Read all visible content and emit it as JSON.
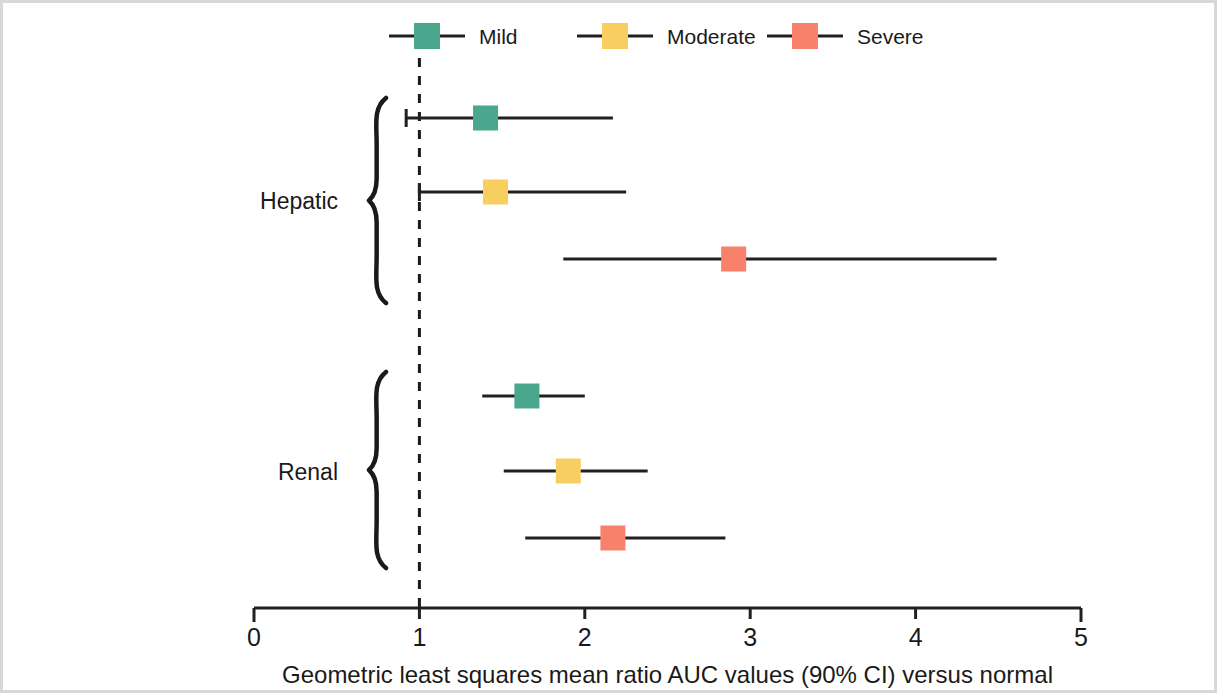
{
  "figure": {
    "axis_title": "Geometric least squares mean ratio AUC values (90% CI) versus normal"
  },
  "legend": {
    "items": [
      {
        "label": "Mild",
        "color": "#4aa68d"
      },
      {
        "label": "Moderate",
        "color": "#f9ce61"
      },
      {
        "label": "Severe",
        "color": "#f8816b"
      }
    ]
  },
  "groups": [
    {
      "label": "Hepatic"
    },
    {
      "label": "Renal"
    }
  ],
  "axis": {
    "ticks": [
      "0",
      "1",
      "2",
      "3",
      "4",
      "5"
    ],
    "reference_value": "1"
  },
  "chart_data": {
    "type": "forest",
    "title": "",
    "subtitle": "",
    "xlabel": "Geometric least squares mean ratio AUC values (90% CI) versus normal",
    "ylabel": "",
    "xlim": [
      0,
      5
    ],
    "xticks": [
      0,
      1,
      2,
      3,
      4,
      5
    ],
    "grid": false,
    "legend_position": "top",
    "reference_line": 1.0,
    "legend": [
      "Mild",
      "Moderate",
      "Severe"
    ],
    "colors": {
      "Mild": "#4aa68d",
      "Moderate": "#f9ce61",
      "Severe": "#f8816b"
    },
    "groups": [
      "Hepatic",
      "Renal"
    ],
    "points": [
      {
        "group": "Hepatic",
        "series": "Mild",
        "estimate": 1.4,
        "ci_low": 0.92,
        "ci_high": 2.17
      },
      {
        "group": "Hepatic",
        "series": "Moderate",
        "estimate": 1.46,
        "ci_low": 1.0,
        "ci_high": 2.25
      },
      {
        "group": "Hepatic",
        "series": "Severe",
        "estimate": 2.9,
        "ci_low": 1.87,
        "ci_high": 4.49
      },
      {
        "group": "Renal",
        "series": "Mild",
        "estimate": 1.65,
        "ci_low": 1.38,
        "ci_high": 2.0
      },
      {
        "group": "Renal",
        "series": "Moderate",
        "estimate": 1.9,
        "ci_low": 1.51,
        "ci_high": 2.38
      },
      {
        "group": "Renal",
        "series": "Severe",
        "estimate": 2.17,
        "ci_low": 1.64,
        "ci_high": 2.85
      }
    ]
  },
  "layout": {
    "x0_px": 254,
    "px_per_unit": 165.4,
    "row_y": [
      118,
      192,
      259,
      396,
      471,
      538
    ],
    "legend_y": 36,
    "legend_x": [
      427,
      615,
      805
    ],
    "axis_y": 608,
    "tick_label_y": 646,
    "axis_title_y": 683,
    "braces": [
      {
        "top": 98,
        "bottom": 303,
        "x": 386,
        "label_y": 201
      },
      {
        "top": 372,
        "bottom": 568,
        "x": 386,
        "label_y": 472
      }
    ]
  }
}
